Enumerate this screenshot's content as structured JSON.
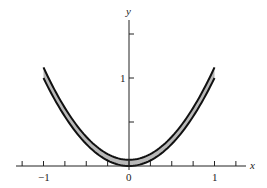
{
  "chart_data": {
    "type": "area",
    "title": "",
    "xlabel": "x",
    "ylabel": "y",
    "xlim": [
      -1.3,
      1.35
    ],
    "ylim": [
      0,
      1.75
    ],
    "x_ticks": [
      -1.25,
      -1,
      -0.75,
      -0.5,
      -0.25,
      0,
      0.25,
      0.5,
      0.75,
      1,
      1.25
    ],
    "x_tick_labels": {
      "-1": "−1",
      "0": "0",
      "1": "1"
    },
    "y_ticks": [
      0.5,
      1,
      1.5
    ],
    "y_tick_labels": {
      "1": "1"
    },
    "grid": false,
    "legend": null,
    "series": [
      {
        "name": "lower curve",
        "formula": "y = x^2",
        "x": [
          -1,
          -0.75,
          -0.5,
          -0.25,
          0,
          0.25,
          0.5,
          0.75,
          1
        ],
        "values": [
          1,
          0.5625,
          0.25,
          0.0625,
          0,
          0.0625,
          0.25,
          0.5625,
          1
        ]
      },
      {
        "name": "upper curve",
        "formula": "y ≈ x^2 + 0.1",
        "x": [
          -1,
          -0.75,
          -0.5,
          -0.25,
          0,
          0.25,
          0.5,
          0.75,
          1
        ],
        "values": [
          1.12,
          0.68,
          0.36,
          0.15,
          0.07,
          0.15,
          0.36,
          0.68,
          1.12
        ]
      }
    ],
    "fill_between": {
      "color": "#b8b8b8",
      "description": "shaded band between the two curves"
    }
  },
  "labels": {
    "x_axis": "x",
    "y_axis": "y",
    "tick_neg1": "−1",
    "tick_0": "0",
    "tick_1": "1",
    "tick_y1": "1"
  },
  "colors": {
    "curve": "#111111",
    "band": "#b8b8b8",
    "axis": "#222222"
  }
}
